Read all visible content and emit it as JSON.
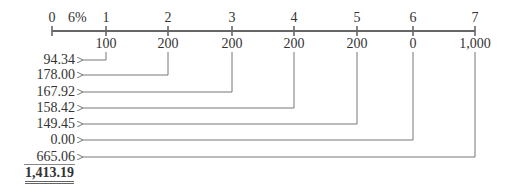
{
  "timeline": {
    "rate_label": "6%",
    "periods": [
      "0",
      "1",
      "2",
      "3",
      "4",
      "5",
      "6",
      "7"
    ],
    "cash_flows": [
      "100",
      "200",
      "200",
      "200",
      "200",
      "0",
      "1,000"
    ]
  },
  "present_values": [
    "94.34",
    "178.00",
    "167.92",
    "158.42",
    "149.45",
    "0.00",
    "665.06"
  ],
  "total": "1,413.19",
  "colors": {
    "line": "#666666",
    "text": "#333333"
  }
}
